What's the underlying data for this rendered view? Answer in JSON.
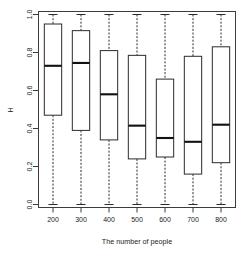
{
  "chart_data": {
    "type": "box",
    "title": "",
    "xlabel": "The number of people",
    "ylabel": "H",
    "categories": [
      "200",
      "300",
      "400",
      "500",
      "600",
      "700",
      "800"
    ],
    "ylim": [
      0.0,
      1.0
    ],
    "yticks": [
      0.0,
      0.2,
      0.4,
      0.6,
      0.8,
      1.0
    ],
    "ytick_labels": [
      "0.0",
      "0.2",
      "0.4",
      "0.6",
      "0.8",
      "1.0"
    ],
    "grid": false,
    "legend": null,
    "boxes": [
      {
        "category": "200",
        "whisker_low": 0.0,
        "q1": 0.47,
        "median": 0.73,
        "q3": 0.95,
        "whisker_high": 1.0
      },
      {
        "category": "300",
        "whisker_low": 0.0,
        "q1": 0.39,
        "median": 0.745,
        "q3": 0.915,
        "whisker_high": 1.0
      },
      {
        "category": "400",
        "whisker_low": 0.0,
        "q1": 0.34,
        "median": 0.58,
        "q3": 0.81,
        "whisker_high": 1.0
      },
      {
        "category": "500",
        "whisker_low": 0.0,
        "q1": 0.24,
        "median": 0.415,
        "q3": 0.785,
        "whisker_high": 1.0
      },
      {
        "category": "600",
        "whisker_low": 0.0,
        "q1": 0.25,
        "median": 0.35,
        "q3": 0.66,
        "whisker_high": 1.0
      },
      {
        "category": "700",
        "whisker_low": 0.0,
        "q1": 0.16,
        "median": 0.33,
        "q3": 0.78,
        "whisker_high": 1.0
      },
      {
        "category": "800",
        "whisker_low": 0.0,
        "q1": 0.22,
        "median": 0.42,
        "q3": 0.83,
        "whisker_high": 1.0
      }
    ],
    "colors": {
      "box_fill": "#ffffff",
      "box_stroke": "#2b2b2b",
      "median": "#111111",
      "axis": "#3c3c3c",
      "background": "#ffffff"
    }
  }
}
